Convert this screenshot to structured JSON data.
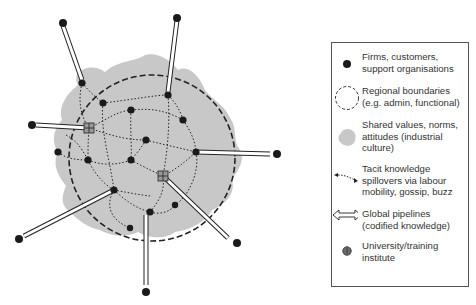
{
  "legend": {
    "items": [
      {
        "icon": "firm-dot-icon",
        "text": "Firms, customers, support organisations"
      },
      {
        "icon": "dashed-circle-icon",
        "text": "Regional boundaries (e.g. admin, functional)"
      },
      {
        "icon": "grey-blob-icon",
        "text": "Shared values, norms, attitudes (industrial culture)"
      },
      {
        "icon": "dotted-double-arrow-icon",
        "text": "Tacit knowledge spillovers via labour mobility, gossip, buzz"
      },
      {
        "icon": "hollow-double-arrow-icon",
        "text": "Global pipelines (codified knowledge)"
      },
      {
        "icon": "globe-grid-icon",
        "text": "University/training institute"
      }
    ]
  },
  "colors": {
    "blob": "#c8c8c8",
    "node": "#1a1a1a",
    "boundary": "#222222",
    "text": "#333333"
  }
}
